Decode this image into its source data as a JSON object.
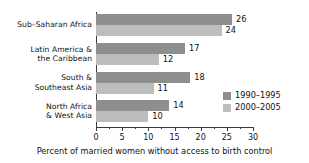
{
  "chart_data": {
    "type": "bar",
    "orientation": "horizontal",
    "title": "",
    "xlabel": "Percent of married women without access to birth control",
    "ylabel": "",
    "xlim": [
      0,
      30
    ],
    "xticks": [
      0,
      5,
      10,
      15,
      20,
      25,
      30
    ],
    "xtick_labels": [
      "0",
      "5",
      "10",
      "15",
      "20",
      "25",
      "30"
    ],
    "minor_tick_step": 2.5,
    "grid": false,
    "legend_position": "inside-lower-right",
    "categories": [
      "Sub–Saharan Africa",
      "Latin America &\nthe Caribbean",
      "South &\nSoutheast Asia",
      "North Africa\n& West Asia"
    ],
    "category_lines": [
      [
        "Sub–Saharan Africa"
      ],
      [
        "Latin America &",
        "the Caribbean"
      ],
      [
        "South &",
        "Southeast Asia"
      ],
      [
        "North Africa",
        "& West Asia"
      ]
    ],
    "series": [
      {
        "name": "1990–1995",
        "color": "#8e8e8e",
        "values": [
          26,
          17,
          18,
          14
        ],
        "value_labels": [
          "26",
          "17",
          "18",
          "14"
        ]
      },
      {
        "name": "2000–2005",
        "color": "#bdbdbd",
        "values": [
          24,
          12,
          11,
          10
        ],
        "value_labels": [
          "24",
          "12",
          "11",
          "10"
        ]
      }
    ]
  }
}
